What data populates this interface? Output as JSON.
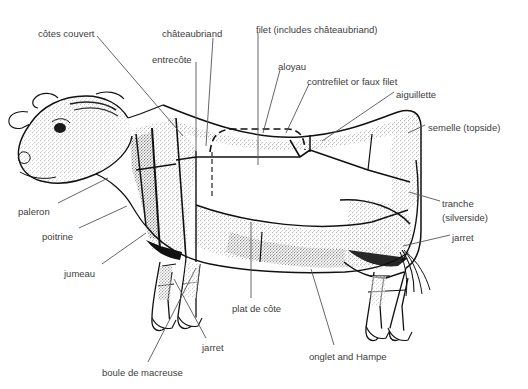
{
  "figure": {
    "background_color": "#ffffff",
    "label_color": "#3d3d3d",
    "line_color": "#555555",
    "artwork_color": "#1a1a1a"
  },
  "labels": [
    {
      "id": "cotes-couvert",
      "text": "côtes couvert",
      "x": 38,
      "y": 28
    },
    {
      "id": "chateaubriand",
      "text": "châteaubriand",
      "x": 162,
      "y": 28
    },
    {
      "id": "filet",
      "text": "filet (includes châteaubriand)",
      "x": 256,
      "y": 24
    },
    {
      "id": "entrecote",
      "text": "entrecôte",
      "x": 152,
      "y": 54
    },
    {
      "id": "aloyau",
      "text": "aloyau",
      "x": 278,
      "y": 61
    },
    {
      "id": "contrefilet",
      "text": "contrefilet or faux filet",
      "x": 307,
      "y": 76
    },
    {
      "id": "aiguillette",
      "text": "aiguillette",
      "x": 396,
      "y": 89
    },
    {
      "id": "semelle",
      "text": "semelle (topside)",
      "x": 428,
      "y": 122
    },
    {
      "id": "tranche",
      "text": "tranche",
      "x": 442,
      "y": 198
    },
    {
      "id": "silverside",
      "text": "(silverside)",
      "x": 442,
      "y": 212
    },
    {
      "id": "jarret-rear",
      "text": "jarret",
      "x": 452,
      "y": 232
    },
    {
      "id": "paleron",
      "text": "paleron",
      "x": 18,
      "y": 206
    },
    {
      "id": "poitrine",
      "text": "poitrine",
      "x": 42,
      "y": 231
    },
    {
      "id": "jumeau",
      "text": "jumeau",
      "x": 64,
      "y": 268
    },
    {
      "id": "boule",
      "text": "boule de macreuse",
      "x": 102,
      "y": 367
    },
    {
      "id": "jarret-front",
      "text": "jarret",
      "x": 202,
      "y": 342
    },
    {
      "id": "plat-de-cote",
      "text": "plat de côte",
      "x": 232,
      "y": 303
    },
    {
      "id": "onglet-hampe",
      "text": "onglet and Hampe",
      "x": 309,
      "y": 351
    }
  ],
  "leaders": [
    {
      "id": "leader-cotes-couvert",
      "d": "M 97 36 L 183 136"
    },
    {
      "id": "leader-chateaubriand",
      "d": "M 213 38 L 206 146"
    },
    {
      "id": "leader-filet",
      "d": "M 258 32 L 258 165"
    },
    {
      "id": "leader-entrecote",
      "d": "M 196 62 L 196 151"
    },
    {
      "id": "leader-aloyau",
      "d": "M 280 70 L 263 133"
    },
    {
      "id": "leader-contrefilet",
      "d": "M 309 84 L 286 133"
    },
    {
      "id": "leader-aiguillette",
      "d": "M 394 92 L 322 141"
    },
    {
      "id": "leader-semelle",
      "d": "M 425 125 L 408 133"
    },
    {
      "id": "leader-tranche",
      "d": "M 440 201 L 409 192"
    },
    {
      "id": "leader-jarret-rear",
      "d": "M 450 235 L 403 246"
    },
    {
      "id": "leader-paleron",
      "d": "M 58 203 L 108 178"
    },
    {
      "id": "leader-poitrine",
      "d": "M 79 228 L 127 206"
    },
    {
      "id": "leader-jumeau",
      "d": "M 102 264 L 146 233"
    },
    {
      "id": "leader-boule",
      "d": "M 148 362 L 196 268"
    },
    {
      "id": "leader-jarret-front",
      "d": "M 206 338 L 174 279"
    },
    {
      "id": "leader-plat-de-cote",
      "d": "M 251 298 L 251 222"
    },
    {
      "id": "leader-onglet-hampe",
      "d": "M 334 345 L 311 269"
    }
  ]
}
